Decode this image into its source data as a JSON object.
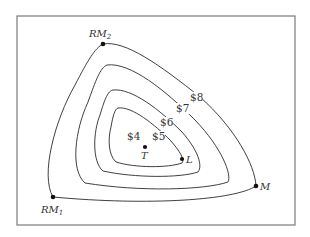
{
  "diagram": {
    "type": "isocost contour map (location triangle)",
    "frame": {
      "x": 17,
      "y": 16,
      "width": 278,
      "height": 209,
      "border_color": "#7a7a7a"
    },
    "points": [
      {
        "id": "RM2",
        "label": "RM",
        "subscript": "2",
        "x": 103,
        "y": 44,
        "label_x": 89,
        "label_y": 37
      },
      {
        "id": "RM1",
        "label": "RM",
        "subscript": "1",
        "x": 53,
        "y": 197,
        "label_x": 41,
        "label_y": 213
      },
      {
        "id": "M",
        "label": "M",
        "x": 256,
        "y": 186,
        "label_x": 260,
        "label_y": 190
      },
      {
        "id": "T",
        "label": "T",
        "x": 145,
        "y": 147,
        "label_x": 141,
        "label_y": 159
      },
      {
        "id": "L",
        "label": "L",
        "x": 182,
        "y": 159,
        "label_x": 186,
        "label_y": 163
      }
    ],
    "contours": [
      {
        "label": "$8",
        "label_x": 190,
        "label_y": 101
      },
      {
        "label": "$7",
        "label_x": 176,
        "label_y": 112
      },
      {
        "label": "$6",
        "label_x": 160,
        "label_y": 126
      },
      {
        "label": "$5",
        "label_x": 152,
        "label_y": 140
      },
      {
        "label": "$4",
        "label_x": 127,
        "label_y": 140
      }
    ],
    "line_color": "#2a2a2a",
    "text_color": "#333333"
  }
}
